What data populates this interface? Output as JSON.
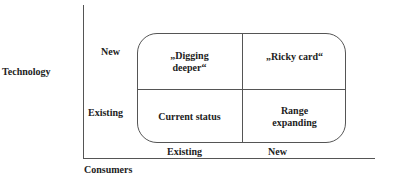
{
  "axes": {
    "y_title": "Technology",
    "x_title": "Consumers",
    "y_ticks": [
      "New",
      "Existing"
    ],
    "x_ticks": [
      "Existing",
      "New"
    ]
  },
  "matrix": {
    "cells": [
      {
        "row": "New",
        "col": "Existing",
        "label_line1": "„Digging",
        "label_line2": "deeper“"
      },
      {
        "row": "New",
        "col": "New",
        "label_line1": "„Ricky card“",
        "label_line2": ""
      },
      {
        "row": "Existing",
        "col": "Existing",
        "label_line1": "Current status",
        "label_line2": ""
      },
      {
        "row": "Existing",
        "col": "New",
        "label_line1": "Range",
        "label_line2": "expanding"
      }
    ]
  },
  "colors": {
    "line": "#555555",
    "text": "#222222",
    "background": "#ffffff"
  }
}
